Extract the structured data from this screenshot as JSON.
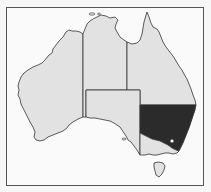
{
  "map": {
    "title": "Australia",
    "highlighted_state": "New South Wales",
    "colors": {
      "background": "#fafafa",
      "land": "#e2e2e2",
      "highlight": "#2b2b2b",
      "border": "#333333",
      "frame": "#555555"
    },
    "regions": [
      {
        "name": "Western Australia",
        "highlighted": false
      },
      {
        "name": "Northern Territory",
        "highlighted": false
      },
      {
        "name": "Queensland",
        "highlighted": false
      },
      {
        "name": "South Australia",
        "highlighted": false
      },
      {
        "name": "New South Wales",
        "highlighted": true
      },
      {
        "name": "Victoria",
        "highlighted": false
      },
      {
        "name": "Tasmania",
        "highlighted": false
      },
      {
        "name": "Australian Capital Territory",
        "highlighted": false,
        "marker": "dot"
      }
    ]
  }
}
